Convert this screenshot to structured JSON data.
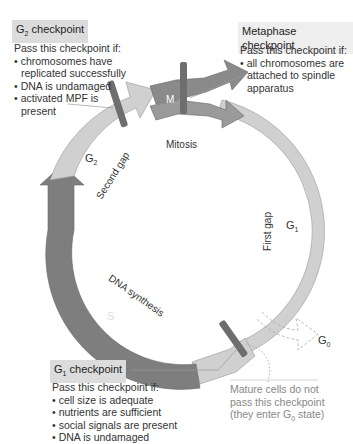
{
  "g2_checkpoint": {
    "title": "G",
    "title_sub": "2",
    "title_rest": " checkpoint",
    "intro": "Pass this checkpoint if:",
    "items": [
      "chromosomes have replicated successfully",
      "DNA is undamaged",
      "activated MPF is present"
    ]
  },
  "metaphase_checkpoint": {
    "title": "Metaphase checkpoint",
    "intro": "Pass this checkpoint if:",
    "items": [
      "all chromosomes are attached to spindle apparatus"
    ]
  },
  "g1_checkpoint": {
    "title": "G",
    "title_sub": "1",
    "title_rest": " checkpoint",
    "intro": "Pass this checkpoint if:",
    "items": [
      "cell size is adequate",
      "nutrients are sufficient",
      "social signals are present",
      "DNA is undamaged"
    ]
  },
  "g0_note": {
    "line1": "Mature cells do not",
    "line2": "pass this checkpoint",
    "line3": "(they enter G",
    "line3_sub": "0",
    "line3_rest": " state)"
  },
  "phases": {
    "m_label": "M",
    "mitosis": "Mitosis",
    "g1_label": "G",
    "g1_sub": "1",
    "first_gap": "First gap",
    "s_label": "S",
    "dna_synthesis": "DNA synthesis",
    "g2_label": "G",
    "g2_sub": "2",
    "second_gap": "Second gap",
    "g0_label": "G",
    "g0_sub": "0"
  },
  "colors": {
    "light_phase": "#d0d0d0",
    "mitosis": "#8a8a8a",
    "s_phase": "#7e7e7e",
    "checkpoint_bar": "#6e6e6e",
    "title_bg": "#dcdcdc",
    "note_text": "#888888"
  }
}
